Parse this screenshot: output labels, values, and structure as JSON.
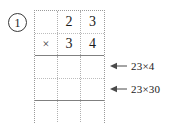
{
  "worksheet": {
    "problem_number": "1",
    "problem": {
      "multiplicand": "23",
      "multiplier": "34",
      "operator": "×"
    },
    "grid": {
      "columns": 3,
      "rows": [
        {
          "name": "multiplicand-row",
          "cells": [
            "",
            "2",
            "3"
          ],
          "border_bottom": "dotted"
        },
        {
          "name": "multiplier-row",
          "cells": [
            "×",
            "3",
            "4"
          ],
          "border_bottom": "solid"
        },
        {
          "name": "partial-product-row-1",
          "cells": [
            "",
            "",
            ""
          ],
          "border_bottom": "dotted"
        },
        {
          "name": "partial-product-row-2",
          "cells": [
            "",
            "",
            ""
          ],
          "border_bottom": "solid"
        },
        {
          "name": "total-row",
          "cells": [
            "",
            "",
            ""
          ],
          "border_bottom": "none"
        }
      ]
    },
    "annotations": [
      {
        "name": "partial-product-1",
        "icon": "left-arrow-icon",
        "label": "23×4"
      },
      {
        "name": "partial-product-2",
        "icon": "left-arrow-icon",
        "label": "23×30"
      }
    ],
    "colors": {
      "ink": "#1a1a1a",
      "grid_solid": "#808080",
      "grid_dotted": "#b0b0b0",
      "background": "#ffffff"
    }
  }
}
